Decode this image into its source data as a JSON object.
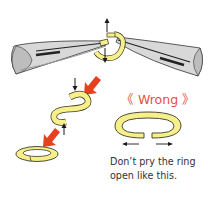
{
  "wrong_example": {
    "label": "《 Wrong 》",
    "caption_lines": [
      "Don’t pry the ring",
      "open like this."
    ]
  },
  "colors": {
    "ring_fill": "#f7ef8a",
    "ring_stroke": "#3a3a2a",
    "plier_fill": "#d8d8d8",
    "plier_shadow": "#a8a8a8",
    "arrow_red": "#e8401c",
    "arrow_black": "#1a1a1a",
    "wrong_text": "#e5503e",
    "caption_text": "#333333"
  },
  "icons": [
    "left-pliers",
    "right-pliers",
    "jump-ring-being-twisted",
    "twisted-ring",
    "closed-ring",
    "pried-open-ring",
    "up-arrow",
    "down-arrow",
    "red-arrow",
    "left-right-arrows"
  ]
}
